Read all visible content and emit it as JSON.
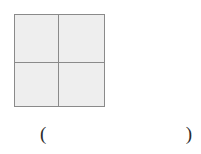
{
  "page": {
    "background_color": "#ffffff",
    "width": 201,
    "height": 154
  },
  "figure": {
    "name": "subdivided-square",
    "shape": "square",
    "fill_color": "#eeeeee",
    "stroke_color": "#8a8a8a",
    "stroke_width": 1,
    "subdivision": {
      "rows": 2,
      "columns": 2,
      "cell_count": 4,
      "divider_color": "#8a8a8a"
    },
    "cells": [
      {
        "label": "",
        "position": "top-left"
      },
      {
        "label": "",
        "position": "top-right"
      },
      {
        "label": "",
        "position": "bottom-left"
      },
      {
        "label": "",
        "position": "bottom-right"
      }
    ]
  },
  "answer_slot": {
    "open_paren": "(",
    "close_paren": ")",
    "value": "",
    "placeholder": ""
  }
}
